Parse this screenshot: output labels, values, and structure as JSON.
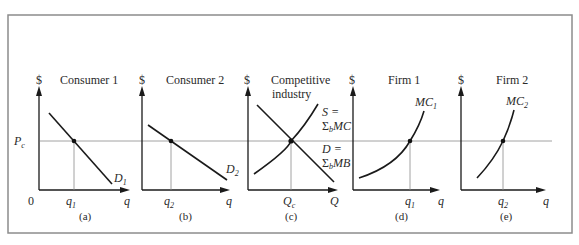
{
  "figure": {
    "price_label": "P",
    "price_sub": "c",
    "origin_label": "0",
    "dollar": "$",
    "panels": [
      {
        "id": "a",
        "title": [
          "Consumer 1"
        ],
        "panel_label": "(a)",
        "x_axis": "q",
        "qty_label": "q",
        "qty_sub": "1",
        "curve_type": "demand",
        "curve_label": "D",
        "curve_sub": "1"
      },
      {
        "id": "b",
        "title": [
          "Consumer 2"
        ],
        "panel_label": "(b)",
        "x_axis": "q",
        "qty_label": "q",
        "qty_sub": "2",
        "curve_type": "demand",
        "curve_label": "D",
        "curve_sub": "2"
      },
      {
        "id": "c",
        "title": [
          "Competitive",
          "industry"
        ],
        "panel_label": "(c)",
        "x_axis": "Q",
        "qty_label": "Q",
        "qty_sub": "c",
        "curve_type": "market",
        "supply_label": [
          "S =",
          "Σ",
          "b",
          "MC"
        ],
        "demand_label": [
          "D =",
          "Σ",
          "b",
          "MB"
        ]
      },
      {
        "id": "d",
        "title": [
          "Firm 1"
        ],
        "panel_label": "(d)",
        "x_axis": "q",
        "qty_label": "q",
        "qty_sub": "1",
        "curve_type": "supply",
        "curve_label": "MC",
        "curve_sub": "1"
      },
      {
        "id": "e",
        "title": [
          "Firm 2"
        ],
        "panel_label": "(e)",
        "x_axis": "q",
        "qty_label": "q",
        "qty_sub": "2",
        "curve_type": "supply",
        "curve_label": "MC",
        "curve_sub": "2"
      }
    ]
  }
}
